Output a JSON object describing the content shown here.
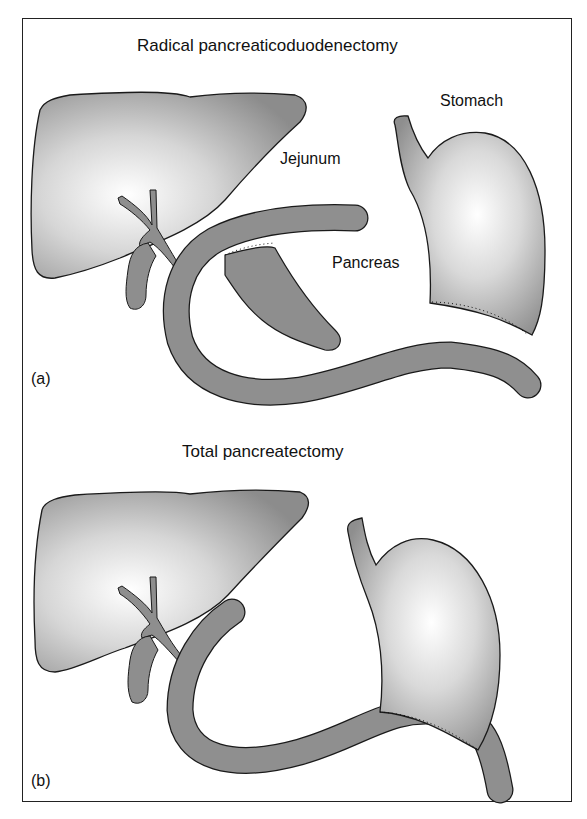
{
  "panel_a": {
    "title": "Radical pancreaticoduodenectomy",
    "labels": {
      "stomach": "Stomach",
      "jejunum": "Jejunum",
      "pancreas": "Pancreas"
    },
    "panel_label": "(a)"
  },
  "panel_b": {
    "title": "Total pancreatectomy",
    "panel_label": "(b)"
  },
  "colors": {
    "organ_dark": "#8a8a8a",
    "organ_light": "#ffffff",
    "bowel": "#8f8f8f",
    "outline": "#1a1a1a"
  }
}
